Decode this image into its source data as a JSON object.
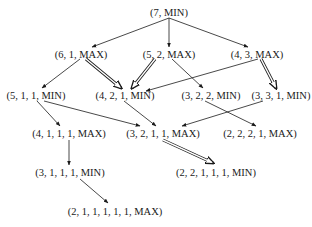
{
  "diagram": {
    "nodes": [
      {
        "id": "n7",
        "label": "(7, MIN)",
        "x": 169,
        "y": 12
      },
      {
        "id": "n61",
        "label": "(6, 1, MAX)",
        "x": 81,
        "y": 54
      },
      {
        "id": "n52",
        "label": "(5, 2, MAX)",
        "x": 169,
        "y": 54
      },
      {
        "id": "n43",
        "label": "(4, 3, MAX)",
        "x": 257,
        "y": 54
      },
      {
        "id": "n511",
        "label": "(5, 1, 1, MIN)",
        "x": 36,
        "y": 95
      },
      {
        "id": "n421",
        "label": "(4, 2, 1, MIN)",
        "x": 125,
        "y": 95
      },
      {
        "id": "n322",
        "label": "(3, 2, 2, MIN)",
        "x": 211,
        "y": 95
      },
      {
        "id": "n331",
        "label": "(3, 3, 1, MIN)",
        "x": 281,
        "y": 95
      },
      {
        "id": "n4111",
        "label": "(4, 1, 1, 1, MAX)",
        "x": 69,
        "y": 133
      },
      {
        "id": "n3211",
        "label": "(3, 2, 1, 1, MAX)",
        "x": 163,
        "y": 133
      },
      {
        "id": "n2221",
        "label": "(2, 2, 2, 1, MAX)",
        "x": 260,
        "y": 133
      },
      {
        "id": "n31111",
        "label": "(3, 1, 1, 1, MIN)",
        "x": 70,
        "y": 172
      },
      {
        "id": "n22111",
        "label": "(2, 2, 1, 1, 1, MIN)",
        "x": 216,
        "y": 172
      },
      {
        "id": "n211111",
        "label": "(2, 1, 1, 1, 1, 1, MAX)",
        "x": 115,
        "y": 211
      }
    ],
    "edges": [
      {
        "from": [
          169,
          18
        ],
        "to": [
          92,
          47
        ],
        "style": "single"
      },
      {
        "from": [
          169,
          18
        ],
        "to": [
          169,
          47
        ],
        "style": "single"
      },
      {
        "from": [
          169,
          18
        ],
        "to": [
          248,
          47
        ],
        "style": "single"
      },
      {
        "from": [
          80,
          59
        ],
        "to": [
          42,
          88
        ],
        "style": "single"
      },
      {
        "from": [
          86,
          59
        ],
        "to": [
          121,
          88
        ],
        "style": "double"
      },
      {
        "from": [
          155,
          59
        ],
        "to": [
          132,
          88
        ],
        "style": "double"
      },
      {
        "from": [
          172,
          59
        ],
        "to": [
          203,
          88
        ],
        "style": "single"
      },
      {
        "from": [
          258,
          59
        ],
        "to": [
          146,
          91
        ],
        "style": "single"
      },
      {
        "from": [
          261,
          59
        ],
        "to": [
          276,
          88
        ],
        "style": "double"
      },
      {
        "from": [
          37,
          101
        ],
        "to": [
          60,
          126
        ],
        "style": "single"
      },
      {
        "from": [
          44,
          101
        ],
        "to": [
          140,
          126
        ],
        "style": "single"
      },
      {
        "from": [
          124,
          101
        ],
        "to": [
          156,
          126
        ],
        "style": "single"
      },
      {
        "from": [
          205,
          101
        ],
        "to": [
          256,
          126
        ],
        "style": "single"
      },
      {
        "from": [
          263,
          101
        ],
        "to": [
          182,
          126
        ],
        "style": "single"
      },
      {
        "from": [
          69,
          140
        ],
        "to": [
          69,
          165
        ],
        "style": "single"
      },
      {
        "from": [
          163,
          140
        ],
        "to": [
          213,
          163
        ],
        "style": "double"
      },
      {
        "from": [
          80,
          179
        ],
        "to": [
          108,
          203
        ],
        "style": "single"
      }
    ]
  }
}
